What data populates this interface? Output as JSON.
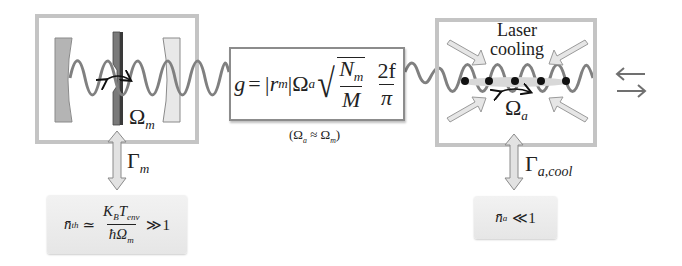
{
  "diagram": {
    "mechanical": {
      "frequency_label": "Ω",
      "frequency_sub": "m",
      "damping_label": "Γ",
      "damping_sub": "m",
      "occupation": {
        "lhs": "n̄",
        "lhs_sub": "th",
        "relation": "≃",
        "numerator": "K",
        "numerator_sub1": "B",
        "numerator_mid": "T",
        "numerator_sub2": "env",
        "denominator": "ħΩ",
        "denominator_sub": "m",
        "comparison": "≫1"
      }
    },
    "coupling": {
      "g": "g",
      "equals": "=",
      "abs_r": "|r",
      "abs_r_sub": "m",
      "abs_close": "|",
      "omega": "Ω",
      "omega_sub": "a",
      "sqrt_num": "N",
      "sqrt_num_sub": "m",
      "sqrt_den": "M",
      "frac_num": "2f",
      "frac_den": "π",
      "condition": "(Ω",
      "condition_sub1": "a",
      "condition_mid": " ≈ Ω",
      "condition_sub2": "m",
      "condition_close": ")"
    },
    "atomic": {
      "title_line1": "Laser",
      "title_line2": "cooling",
      "frequency_label": "Ω",
      "frequency_sub": "a",
      "damping_label": "Γ",
      "damping_sub": "a,cool",
      "occupation": {
        "lhs": "n̄",
        "lhs_sub": "a",
        "comparison": "≪1"
      }
    },
    "colors": {
      "box_border": "#bdbdbd",
      "wave": "#808080",
      "mirror_left": "#b4b4b4",
      "mirror_right": "#e4e4e4",
      "membrane": "#6e6e6e",
      "arrow_fill": "#e2e2e2",
      "atom": "#111111"
    }
  }
}
